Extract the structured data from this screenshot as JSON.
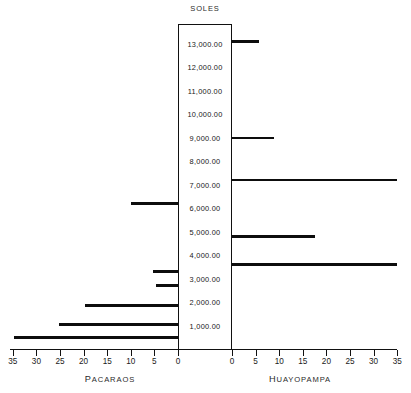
{
  "chart_data": {
    "type": "bar",
    "orientation": "horizontal-tornado",
    "title": "SOLES",
    "xlabel": "",
    "ylabel": "SOLES",
    "grid": false,
    "legend_position": "none",
    "categories": [
      "13,000.00",
      "12,000.00",
      "11,000.00",
      "10,000.00",
      "9,000.00",
      "8,000.00",
      "7,000.00",
      "6,000.00",
      "5,000.00",
      "4,000.00",
      "3,000.00",
      "2,000.00",
      "1,000.00"
    ],
    "y_tick_labels": [
      "13,000.00",
      "12,000.00",
      "11,000.00",
      "10,000.00",
      "9,000.00",
      "8,000.00",
      "7,000.00",
      "6,000.00",
      "5,000.00",
      "4,000.00",
      "3,000.00",
      "2,000.00",
      "1,000.00"
    ],
    "ylim": [
      0,
      14000
    ],
    "xlim_left": [
      0,
      35
    ],
    "xlim_right": [
      0,
      35
    ],
    "x_tick_labels_left": [
      "35",
      "30",
      "25",
      "20",
      "15",
      "10",
      "5",
      "0"
    ],
    "x_tick_labels_right": [
      "0",
      "5",
      "10",
      "15",
      "20",
      "25",
      "30",
      "35"
    ],
    "x_tick_values_left": [
      35,
      30,
      25,
      20,
      15,
      10,
      5,
      0
    ],
    "x_tick_values_right": [
      0,
      5,
      10,
      15,
      20,
      25,
      30,
      35
    ],
    "series": [
      {
        "name": "PACARAOS",
        "side": "left",
        "bars": [
          {
            "value_soles": 6200,
            "count": 10.0
          },
          {
            "value_soles": 3300,
            "count": 5.2
          },
          {
            "value_soles": 2700,
            "count": 4.6
          },
          {
            "value_soles": 1850,
            "count": 19.6
          },
          {
            "value_soles": 1050,
            "count": 25.2
          },
          {
            "value_soles": 500,
            "count": 34.8
          }
        ]
      },
      {
        "name": "HUAYOPAMPA",
        "side": "right",
        "bars": [
          {
            "value_soles": 13100,
            "count": 5.8
          },
          {
            "value_soles": 9000,
            "count": 9.0
          },
          {
            "value_soles": 7200,
            "count": 35.0
          },
          {
            "value_soles": 4800,
            "count": 17.6
          },
          {
            "value_soles": 3600,
            "count": 35.0
          }
        ]
      }
    ]
  },
  "labels": {
    "title": "SOLES",
    "left_caption": "PACARAOS",
    "right_caption": "HUAYOPAMPA"
  },
  "colors": {
    "bar": "#0d0d0d",
    "axis": "#111111",
    "text": "#1a1a1a",
    "background": "#ffffff"
  }
}
